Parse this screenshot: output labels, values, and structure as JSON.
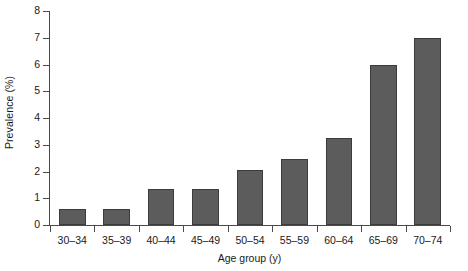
{
  "chart_data": {
    "type": "bar",
    "title": "",
    "subtitle": "",
    "xlabel": "Age group (y)",
    "ylabel": "Prevalence (%)",
    "categories": [
      "30–34",
      "35–39",
      "40–44",
      "45–49",
      "50–54",
      "55–59",
      "60–64",
      "65–69",
      "70–74"
    ],
    "values": [
      0.6,
      0.6,
      1.35,
      1.35,
      2.05,
      2.45,
      3.25,
      6.0,
      7.0
    ],
    "series": [
      {
        "name": "Prevalence",
        "values": [
          0.6,
          0.6,
          1.35,
          1.35,
          2.05,
          2.45,
          3.25,
          6.0,
          7.0
        ]
      }
    ],
    "ylim": [
      0,
      8
    ],
    "ytick_labels": [
      "0",
      "1",
      "2",
      "3",
      "4",
      "5",
      "6",
      "7",
      "8"
    ],
    "ytick_values": [
      0,
      1,
      2,
      3,
      4,
      5,
      6,
      7,
      8
    ],
    "grid": false,
    "legend": false,
    "legend_position": "none",
    "bar_color": "#5c5c5c",
    "bar_edge_color": "#3c3c3c",
    "axis_color": "#4a4a4a",
    "background_color": "#ffffff",
    "annotations": []
  }
}
